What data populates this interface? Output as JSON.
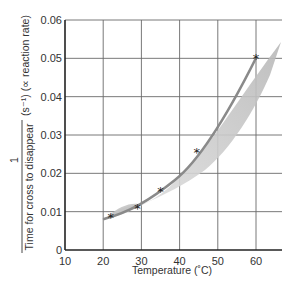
{
  "chart_data": {
    "type": "line",
    "title": "",
    "xlabel": "Temperature (˚C)",
    "ylabel_numerator": "1",
    "ylabel_denominator": "Time for cross to disappear",
    "ylabel_units": "(s⁻¹)  (∝ reaction rate)",
    "xlim": [
      10,
      66
    ],
    "ylim": [
      0,
      0.06
    ],
    "x_ticks": [
      10,
      20,
      30,
      40,
      50,
      60
    ],
    "x_tick_labels": [
      "10",
      "20",
      "30",
      "40",
      "50",
      "60"
    ],
    "y_ticks": [
      0,
      0.01,
      0.02,
      0.03,
      0.04,
      0.05,
      0.06
    ],
    "y_tick_labels": [
      "0",
      "0.01",
      "0.02",
      "0.03",
      "0.04",
      "0.05",
      "0.06"
    ],
    "grid": true,
    "legend": null,
    "series": [
      {
        "name": "Measured rate",
        "marker": "star",
        "x": [
          22,
          29,
          35,
          44.5,
          60
        ],
        "y": [
          0.0085,
          0.011,
          0.0155,
          0.0255,
          0.05
        ]
      }
    ],
    "annotations": [
      "Shaded grey uncertainty band around fitted curve"
    ],
    "colors": {
      "curve": "#8a8a8a",
      "band": "#c8c8c8",
      "grid": "#555555",
      "marker": "#222222"
    }
  }
}
